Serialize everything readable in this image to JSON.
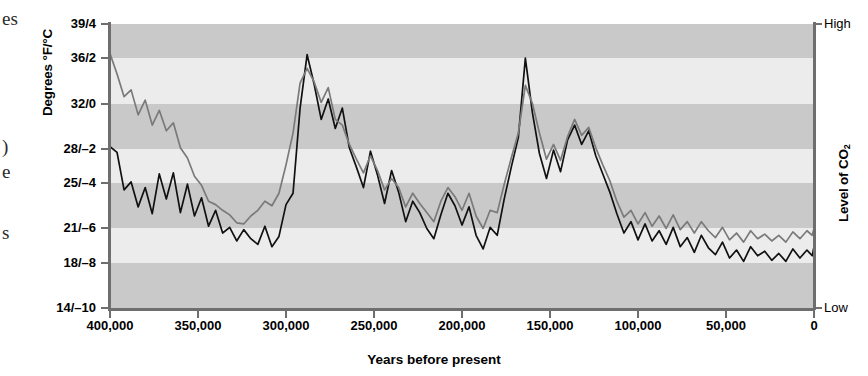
{
  "margin_fragments": [
    {
      "text": "es",
      "top": 8
    },
    {
      "text": ")",
      "top": 136
    },
    {
      "text": "e",
      "top": 161
    },
    {
      "text": "s",
      "top": 222
    }
  ],
  "axes": {
    "y_title": "Degrees °F/°C",
    "y2_title_prefix": "Level of CO",
    "y2_title_sub": "2",
    "x_title": "Years before present"
  },
  "chart_data": {
    "type": "line",
    "title": "",
    "subtitle": "",
    "xlabel": "Years before present",
    "ylabel": "Degrees °F/°C",
    "y2label": "Level of CO2",
    "grid": false,
    "legend": "none",
    "background_bands": "alternating light and dark horizontal gray bands, one band per y-axis tick interval",
    "x_axis": {
      "ticks": [
        400000,
        350000,
        300000,
        250000,
        200000,
        150000,
        100000,
        50000,
        0
      ],
      "tick_labels": [
        "400,000",
        "350,000",
        "300,000",
        "250,000",
        "200,000",
        "150,000",
        "100,000",
        "50,000",
        "0"
      ],
      "xlim": [
        400000,
        0
      ],
      "direction": "reversed (oldest at left, present at right)"
    },
    "y_axis": {
      "ticks": [
        14,
        18,
        21,
        25,
        28,
        32,
        36,
        39
      ],
      "tick_labels": [
        "14/–10",
        "18/–8",
        "21/–6",
        "25/–4",
        "28/–2",
        "32/0",
        "36/2",
        "39/4"
      ],
      "ylim": [
        14,
        39
      ],
      "units": "°F / °C dual scale"
    },
    "y2_axis": {
      "tick_labels": [
        "Low",
        "High"
      ],
      "ylim": [
        "Low",
        "High"
      ]
    },
    "series": [
      {
        "name": "Temperature",
        "color": "#111111",
        "width": 1.7,
        "x": [
          400000,
          396000,
          392000,
          388000,
          384000,
          380000,
          376000,
          372000,
          368000,
          364000,
          360000,
          356000,
          352000,
          348000,
          344000,
          340000,
          336000,
          332000,
          328000,
          324000,
          320000,
          316000,
          312000,
          308000,
          304000,
          300000,
          296000,
          292000,
          288000,
          284000,
          280000,
          276000,
          272000,
          268000,
          264000,
          260000,
          256000,
          252000,
          248000,
          244000,
          240000,
          236000,
          232000,
          228000,
          224000,
          220000,
          216000,
          212000,
          208000,
          204000,
          200000,
          196000,
          192000,
          188000,
          184000,
          180000,
          176000,
          172000,
          168000,
          164000,
          160000,
          156000,
          152000,
          148000,
          144000,
          140000,
          136000,
          132000,
          128000,
          124000,
          120000,
          116000,
          112000,
          108000,
          104000,
          100000,
          96000,
          92000,
          88000,
          84000,
          80000,
          76000,
          72000,
          68000,
          64000,
          60000,
          56000,
          52000,
          48000,
          44000,
          40000,
          36000,
          32000,
          28000,
          24000,
          20000,
          16000,
          12000,
          8000,
          4000,
          1000,
          0
        ],
        "values": [
          28.2,
          27.7,
          24.4,
          25.1,
          22.9,
          24.6,
          22.3,
          25.8,
          23.6,
          25.9,
          22.4,
          24.9,
          22.1,
          23.7,
          21.2,
          22.6,
          20.6,
          21.1,
          19.9,
          20.9,
          20.1,
          19.6,
          21.2,
          19.4,
          20.3,
          23.1,
          24.1,
          31.6,
          36.3,
          33.7,
          30.6,
          32.4,
          29.8,
          31.6,
          28.1,
          26.4,
          24.6,
          27.8,
          25.7,
          23.2,
          26.1,
          24.2,
          21.6,
          23.4,
          22.4,
          21.0,
          20.1,
          22.2,
          24.1,
          23.0,
          21.3,
          22.9,
          20.4,
          19.2,
          21.1,
          20.4,
          23.6,
          26.4,
          29.0,
          36.0,
          31.2,
          27.6,
          25.4,
          27.9,
          26.0,
          28.8,
          30.1,
          28.4,
          29.6,
          27.4,
          25.8,
          24.2,
          22.3,
          20.6,
          21.6,
          20.0,
          21.4,
          19.9,
          20.8,
          19.6,
          21.1,
          19.4,
          20.2,
          18.9,
          20.4,
          19.3,
          18.7,
          19.8,
          18.4,
          19.1,
          18.1,
          19.4,
          18.6,
          19.0,
          18.2,
          18.8,
          18.1,
          19.2,
          18.4,
          19.1,
          18.6,
          19.4
        ]
      },
      {
        "name": "CO2",
        "color": "#7a7a7a",
        "width": 1.7,
        "x": [
          400000,
          396000,
          392000,
          388000,
          384000,
          380000,
          376000,
          372000,
          368000,
          364000,
          360000,
          356000,
          352000,
          348000,
          344000,
          340000,
          336000,
          332000,
          328000,
          324000,
          320000,
          316000,
          312000,
          308000,
          304000,
          300000,
          296000,
          292000,
          288000,
          284000,
          280000,
          276000,
          272000,
          268000,
          264000,
          260000,
          256000,
          252000,
          248000,
          244000,
          240000,
          236000,
          232000,
          228000,
          224000,
          220000,
          216000,
          212000,
          208000,
          204000,
          200000,
          196000,
          192000,
          188000,
          184000,
          180000,
          176000,
          172000,
          168000,
          164000,
          160000,
          156000,
          152000,
          148000,
          144000,
          140000,
          136000,
          132000,
          128000,
          124000,
          120000,
          116000,
          112000,
          108000,
          104000,
          100000,
          96000,
          92000,
          88000,
          84000,
          80000,
          76000,
          72000,
          68000,
          64000,
          60000,
          56000,
          52000,
          48000,
          44000,
          40000,
          36000,
          32000,
          28000,
          24000,
          20000,
          16000,
          12000,
          8000,
          4000,
          1000,
          0
        ],
        "values": [
          36.4,
          34.6,
          32.6,
          33.2,
          31.0,
          32.3,
          30.1,
          31.4,
          29.6,
          30.3,
          28.1,
          27.2,
          25.6,
          24.8,
          23.4,
          23.1,
          22.6,
          22.2,
          21.5,
          21.4,
          22.1,
          22.6,
          23.4,
          23.0,
          24.1,
          26.6,
          29.4,
          33.8,
          35.1,
          33.9,
          32.1,
          33.4,
          30.6,
          30.1,
          28.4,
          27.1,
          25.9,
          27.4,
          26.1,
          24.4,
          25.4,
          24.6,
          22.9,
          24.1,
          23.2,
          22.4,
          21.6,
          23.4,
          24.6,
          23.8,
          22.6,
          24.1,
          22.1,
          21.0,
          22.6,
          22.4,
          24.9,
          27.2,
          29.4,
          33.6,
          32.0,
          29.4,
          27.1,
          28.4,
          27.0,
          29.1,
          30.6,
          29.2,
          29.9,
          28.1,
          26.6,
          25.2,
          23.4,
          22.0,
          22.6,
          21.4,
          22.4,
          21.2,
          22.1,
          21.0,
          22.2,
          20.9,
          21.6,
          20.6,
          21.6,
          20.8,
          20.2,
          21.1,
          20.0,
          20.6,
          19.8,
          20.8,
          20.1,
          20.5,
          19.9,
          20.4,
          19.8,
          20.7,
          20.1,
          20.8,
          20.4,
          21.0
        ]
      }
    ]
  }
}
